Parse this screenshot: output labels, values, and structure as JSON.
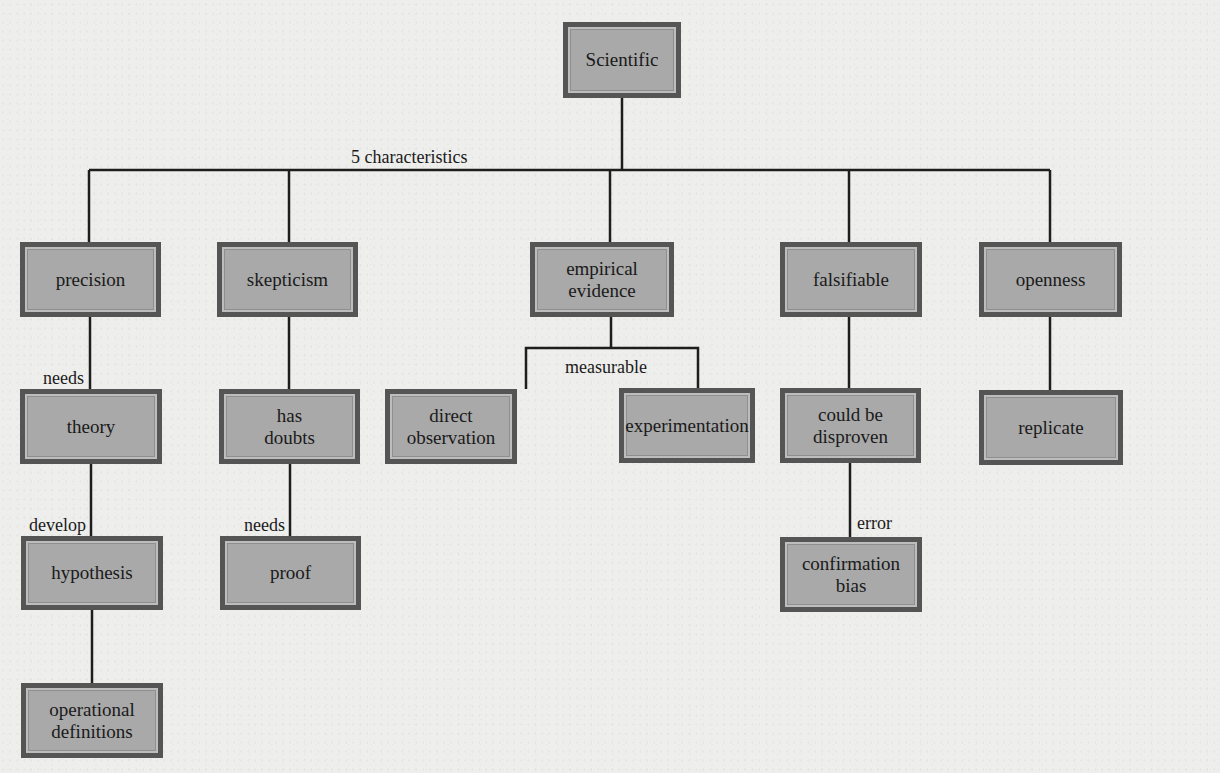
{
  "diagram": {
    "type": "concept-map",
    "root": {
      "id": "scientific",
      "label": "Scientific",
      "box": [
        563,
        22,
        118,
        76
      ]
    },
    "nodes": [
      {
        "id": "precision",
        "label": "precision",
        "box": [
          20,
          242,
          141,
          75
        ]
      },
      {
        "id": "skepticism",
        "label": "skepticism",
        "box": [
          217,
          242,
          141,
          75
        ]
      },
      {
        "id": "empirical-evidence",
        "label": "empirical\nevidence",
        "box": [
          530,
          242,
          144,
          75
        ]
      },
      {
        "id": "falsifiable",
        "label": "falsifiable",
        "box": [
          780,
          242,
          142,
          75
        ]
      },
      {
        "id": "openness",
        "label": "openness",
        "box": [
          979,
          242,
          143,
          75
        ]
      },
      {
        "id": "theory",
        "label": "theory",
        "box": [
          20,
          389,
          142,
          75
        ]
      },
      {
        "id": "has-doubts",
        "label": "has\ndoubts",
        "box": [
          219,
          389,
          141,
          75
        ]
      },
      {
        "id": "direct-observation",
        "label": "direct\nobservation",
        "box": [
          385,
          389,
          132,
          75
        ]
      },
      {
        "id": "experimentation",
        "label": "experimentation",
        "box": [
          619,
          388,
          136,
          75
        ]
      },
      {
        "id": "could-be-disproven",
        "label": "could be\ndisproven",
        "box": [
          780,
          388,
          141,
          75
        ]
      },
      {
        "id": "replicate",
        "label": "replicate",
        "box": [
          979,
          390,
          144,
          75
        ]
      },
      {
        "id": "hypothesis",
        "label": "hypothesis",
        "box": [
          21,
          536,
          142,
          74
        ]
      },
      {
        "id": "proof",
        "label": "proof",
        "box": [
          220,
          536,
          141,
          74
        ]
      },
      {
        "id": "confirmation-bias",
        "label": "confirmation\nbias",
        "box": [
          780,
          537,
          142,
          75
        ]
      },
      {
        "id": "operational-definitions",
        "label": "operational\ndefinitions",
        "box": [
          21,
          683,
          142,
          75
        ]
      }
    ],
    "edge_labels": [
      {
        "id": "five-characteristics",
        "text": "5 characteristics",
        "pos": [
          351,
          147
        ]
      },
      {
        "id": "needs-theory",
        "text": "needs",
        "pos": [
          43,
          368
        ]
      },
      {
        "id": "develop",
        "text": "develop",
        "pos": [
          29,
          515
        ]
      },
      {
        "id": "needs-proof",
        "text": "needs",
        "pos": [
          244,
          515
        ]
      },
      {
        "id": "measurable",
        "text": "measurable",
        "pos": [
          565,
          357
        ]
      },
      {
        "id": "error",
        "text": "error",
        "pos": [
          857,
          513
        ]
      }
    ],
    "edges": [
      {
        "from": "scientific",
        "to": "precision",
        "label": "5 characteristics"
      },
      {
        "from": "scientific",
        "to": "skepticism",
        "label": "5 characteristics"
      },
      {
        "from": "scientific",
        "to": "empirical-evidence",
        "label": "5 characteristics"
      },
      {
        "from": "scientific",
        "to": "falsifiable",
        "label": "5 characteristics"
      },
      {
        "from": "scientific",
        "to": "openness",
        "label": "5 characteristics"
      },
      {
        "from": "precision",
        "to": "theory",
        "label": "needs"
      },
      {
        "from": "theory",
        "to": "hypothesis",
        "label": "develop"
      },
      {
        "from": "hypothesis",
        "to": "operational-definitions",
        "label": ""
      },
      {
        "from": "skepticism",
        "to": "has-doubts",
        "label": ""
      },
      {
        "from": "has-doubts",
        "to": "proof",
        "label": "needs"
      },
      {
        "from": "empirical-evidence",
        "to": "direct-observation",
        "label": "measurable"
      },
      {
        "from": "empirical-evidence",
        "to": "experimentation",
        "label": "measurable"
      },
      {
        "from": "falsifiable",
        "to": "could-be-disproven",
        "label": ""
      },
      {
        "from": "could-be-disproven",
        "to": "confirmation-bias",
        "label": "error"
      },
      {
        "from": "openness",
        "to": "replicate",
        "label": ""
      }
    ]
  },
  "colors": {
    "background": "#eeeeec",
    "node_fill": "#a9a9a9",
    "node_border": "#555555",
    "line": "#1e1e1e",
    "text": "#1a1a1a"
  }
}
